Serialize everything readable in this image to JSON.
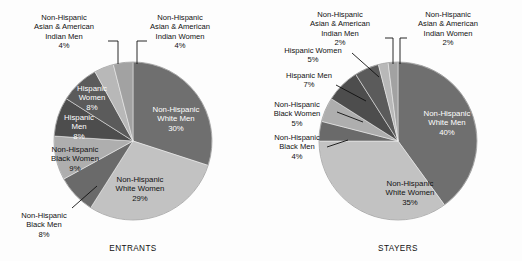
{
  "figure": {
    "background": "#fdfdfd",
    "charts": [
      {
        "id": "entrants",
        "caption": "ENTRANTS",
        "caption_x": 133,
        "caption_y": 251
      },
      {
        "id": "stayers",
        "caption": "STAYERS",
        "caption_x": 398,
        "caption_y": 251
      }
    ]
  },
  "chart_data": [
    {
      "type": "pie",
      "title": "ENTRANTS",
      "center": [
        133,
        141
      ],
      "radius": 79,
      "start_angle": -90,
      "direction": "clockwise",
      "categories": [
        "Non-Hispanic White Men",
        "Non-Hispanic White Women",
        "Non-Hispanic Black Men",
        "Non-Hispanic Black Women",
        "Hispanic Men",
        "Hispanic Women",
        "Non-Hispanic Asian & American Indian Men",
        "Non-Hispanic Asian & American Indian Women"
      ],
      "values": [
        30,
        29,
        8,
        9,
        8,
        8,
        4,
        4
      ],
      "unit": "%",
      "colors": [
        "#6f6f6f",
        "#c2c2c2",
        "#6a6a6a",
        "#aeaeae",
        "#4d4d4d",
        "#5b5b5b",
        "#b8b8b8",
        "#a2a2a2"
      ],
      "slices": [
        {
          "label": "Non-Hispanic\nWhite Men",
          "value": "30%",
          "color": "#6f6f6f",
          "label_kind": "inner-light",
          "label_lines": [
            "Non-Hispanic",
            "White Men",
            "30%"
          ],
          "label_x": 176,
          "label_y": 112
        },
        {
          "label": "Non-Hispanic\nWhite Women",
          "value": "29%",
          "color": "#c2c2c2",
          "label_kind": "inner-dark",
          "label_lines": [
            "Non-Hispanic",
            "White Women",
            "29%"
          ],
          "label_x": 140,
          "label_y": 182
        },
        {
          "label": "Non-Hispanic\nBlack Men",
          "value": "8%",
          "color": "#6a6a6a",
          "label_kind": "outer",
          "label_lines": [
            "Non-Hispanic",
            "Black Men",
            "8%"
          ],
          "label_x": 44,
          "label_y": 218,
          "anchor": "middle",
          "leader": "M 72,208 L 97,186"
        },
        {
          "label": "Non-Hispanic\nBlack Women",
          "value": "9%",
          "color": "#aeaeae",
          "label_kind": "inner-dark",
          "label_lines": [
            "Non-Hispanic",
            "Black Women",
            "9%"
          ],
          "label_x": 75,
          "label_y": 152
        },
        {
          "label": "Hispanic\nMen",
          "value": "8%",
          "color": "#4d4d4d",
          "label_kind": "inner-light",
          "label_lines": [
            "Hispanic",
            "Men",
            "8%"
          ],
          "label_x": 79,
          "label_y": 120
        },
        {
          "label": "Hispanic\nWomen",
          "value": "8%",
          "color": "#5b5b5b",
          "label_kind": "inner-light",
          "label_lines": [
            "Hispanic",
            "Women",
            "8%"
          ],
          "label_x": 92,
          "label_y": 91
        },
        {
          "label": "Non-Hispanic Asian & American Indian Men",
          "value": "4%",
          "color": "#b8b8b8",
          "label_kind": "outer",
          "label_lines": [
            "Non-Hispanic",
            "Asian & American",
            "Indian Men",
            "4%"
          ],
          "label_x": 64,
          "label_y": 20,
          "anchor": "middle",
          "leader": "M 108,41 L 118,41 L 118,64"
        },
        {
          "label": "Non-Hispanic Asian & American Indian Women",
          "value": "4%",
          "color": "#a2a2a2",
          "label_kind": "outer",
          "label_lines": [
            "Non-Hispanic",
            "Asian & American",
            "Indian Women",
            "4%"
          ],
          "label_x": 180,
          "label_y": 20,
          "anchor": "middle",
          "leader": "M 147,41 L 137,41 L 137,64"
        }
      ]
    },
    {
      "type": "pie",
      "title": "STAYERS",
      "center": [
        398,
        141
      ],
      "radius": 79,
      "start_angle": -90,
      "direction": "clockwise",
      "categories": [
        "Non-Hispanic White Men",
        "Non-Hispanic White Women",
        "Non-Hispanic Black Men",
        "Non-Hispanic Black Women",
        "Hispanic Men",
        "Hispanic Women",
        "Non-Hispanic Asian & American Indian Men",
        "Non-Hispanic Asian & American Indian Women"
      ],
      "values": [
        40,
        35,
        4,
        5,
        7,
        5,
        2,
        2
      ],
      "unit": "%",
      "colors": [
        "#6f6f6f",
        "#c2c2c2",
        "#6a6a6a",
        "#aeaeae",
        "#4d4d4d",
        "#5b5b5b",
        "#b8b8b8",
        "#a2a2a2"
      ],
      "slices": [
        {
          "label": "Non-Hispanic\nWhite Men",
          "value": "40%",
          "color": "#6f6f6f",
          "label_kind": "inner-light",
          "label_lines": [
            "Non-Hispanic",
            "White Men",
            "40%"
          ],
          "label_x": 447,
          "label_y": 116
        },
        {
          "label": "Non-Hispanic\nWhite Women",
          "value": "35%",
          "color": "#c2c2c2",
          "label_kind": "inner-dark",
          "label_lines": [
            "Non-Hispanic",
            "White Women",
            "35%"
          ],
          "label_x": 410,
          "label_y": 186
        },
        {
          "label": "Non-Hispanic\nBlack Men",
          "value": "4%",
          "color": "#6a6a6a",
          "label_kind": "outer",
          "label_lines": [
            "Non-Hispanic",
            "Black Men",
            "4%"
          ],
          "label_x": 297,
          "label_y": 140,
          "anchor": "middle",
          "leader": "M 327,147 L 348,140"
        },
        {
          "label": "Non-Hispanic\nBlack Women",
          "value": "5%",
          "color": "#aeaeae",
          "label_kind": "outer",
          "label_lines": [
            "Non-Hispanic",
            "Black Women",
            "5%"
          ],
          "label_x": 297,
          "label_y": 107,
          "anchor": "middle",
          "leader": "M 337,112 L 363,122"
        },
        {
          "label": "Hispanic Men",
          "value": "7%",
          "color": "#4d4d4d",
          "label_kind": "outer",
          "label_lines": [
            "Hispanic Men",
            "7%"
          ],
          "label_x": 309,
          "label_y": 78,
          "anchor": "middle",
          "leader": "M 336,85 L 366,101"
        },
        {
          "label": "Hispanic Women",
          "value": "5%",
          "color": "#5b5b5b",
          "label_kind": "outer",
          "label_lines": [
            "Hispanic Women",
            "5%"
          ],
          "label_x": 313,
          "label_y": 53,
          "anchor": "middle",
          "leader": "M 352,53 L 379,77"
        },
        {
          "label": "Non-Hispanic Asian & American Indian Men",
          "value": "2%",
          "color": "#b8b8b8",
          "label_kind": "outer",
          "label_lines": [
            "Non-Hispanic",
            "Asian & American",
            "Indian Men",
            "2%"
          ],
          "label_x": 340,
          "label_y": 17,
          "anchor": "middle",
          "leader": "M 385,38 L 393,38 L 393,64"
        },
        {
          "label": "Non-Hispanic Asian & American Indian Women",
          "value": "2%",
          "color": "#a2a2a2",
          "label_kind": "outer",
          "label_lines": [
            "Non-Hispanic",
            "Asian & American",
            "Indian Women",
            "2%"
          ],
          "label_x": 448,
          "label_y": 17,
          "anchor": "middle",
          "leader": "M 407,38 L 400,38 L 400,64"
        }
      ]
    }
  ]
}
